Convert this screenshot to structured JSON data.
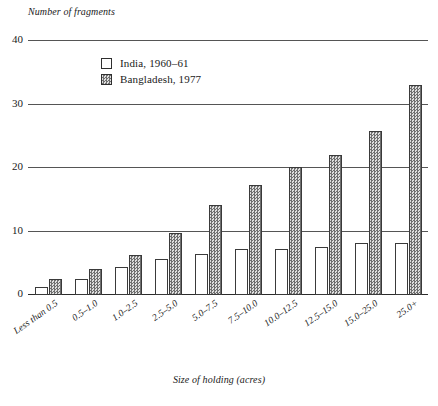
{
  "chart_data": {
    "type": "bar",
    "title": "",
    "ylabel": "Number of fragments",
    "xlabel": "Size of holding (acres)",
    "ylim": [
      0,
      40
    ],
    "yticks": [
      0,
      10,
      20,
      30,
      40
    ],
    "ytick_labels": [
      "0",
      "10",
      "20",
      "30",
      "40"
    ],
    "grid": true,
    "legend_position": "top-center",
    "categories": [
      "Less than 0.5",
      "0.5–1.0",
      "1.0–2.5",
      "2.5–5.0",
      "5.0–7.5",
      "7.5–10.0",
      "10.0–12.5",
      "12.5–15.0",
      "15.0–25.0",
      "25.0+"
    ],
    "series": [
      {
        "name": "India, 1960–61",
        "values": [
          1.2,
          2.6,
          4.4,
          5.6,
          6.5,
          7.2,
          7.2,
          7.6,
          8.2,
          8.2
        ]
      },
      {
        "name": "Bangladesh, 1977",
        "values": [
          2.5,
          4.1,
          6.3,
          9.8,
          14.2,
          17.4,
          20.2,
          22.1,
          25.8,
          33.0
        ]
      }
    ]
  },
  "legend": {
    "items": [
      {
        "label": "India, 1960–61",
        "swatch": "white-open-square"
      },
      {
        "label": "Bangladesh, 1977",
        "swatch": "gray-hatched-square"
      }
    ]
  }
}
